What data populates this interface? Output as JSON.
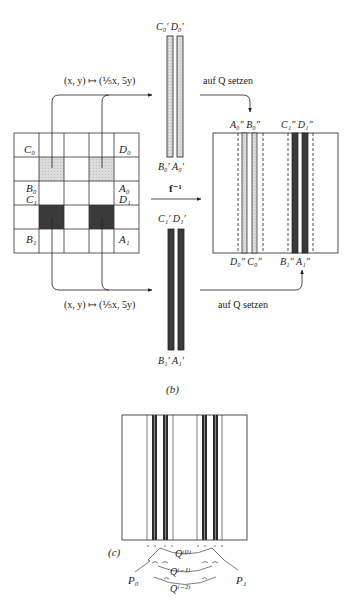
{
  "figure": {
    "panel_b_label": "(b)",
    "panel_c_label": "(c)",
    "map_label_top": "(x, y) ↦ (⅕x, 5y)",
    "map_label_bottom": "(x, y) ↦ (⅕x, 5y)",
    "set_on_Q_top": "auf Q setzen",
    "set_on_Q_bottom": "auf Q setzen",
    "inverse_map_label": "f⁻¹",
    "grid": {
      "rows": 5,
      "cols": 5,
      "corner_labels": {
        "C0": "C₀",
        "D0": "D₀",
        "B0": "B₀",
        "A0": "A₀",
        "C1": "C₁",
        "D1": "D₁",
        "B1": "B₁",
        "A1": "A₁"
      },
      "light_cells": [
        [
          1,
          1
        ],
        [
          1,
          3
        ]
      ],
      "dark_cells": [
        [
          3,
          1
        ],
        [
          3,
          3
        ]
      ]
    },
    "strips_top": {
      "top_labels": "C₀′ D₀′",
      "bottom_labels": "B₀′ A₀′",
      "shade": "light"
    },
    "strips_bottom": {
      "top_labels": "C₁′ D₁′",
      "bottom_labels": "B₁′ A₁′",
      "shade": "dark"
    },
    "result_box": {
      "top_labels_left": "A₀″ B₀″",
      "top_labels_right": "C₁″ D₁″",
      "bottom_labels_left": "D₀″ C₀″",
      "bottom_labels_right": "B₁″ A₁″"
    },
    "panel_c": {
      "P0": "P₀",
      "P1": "P₁",
      "Q0": "Q⁽⁰⁾",
      "Qm1": "Q⁽⁻¹⁾",
      "Qm2": "Q⁽⁻²⁾"
    },
    "colors": {
      "ink": "#222222",
      "light_fill": "#d4d4d4",
      "dark_fill": "#3a3a3a"
    }
  }
}
